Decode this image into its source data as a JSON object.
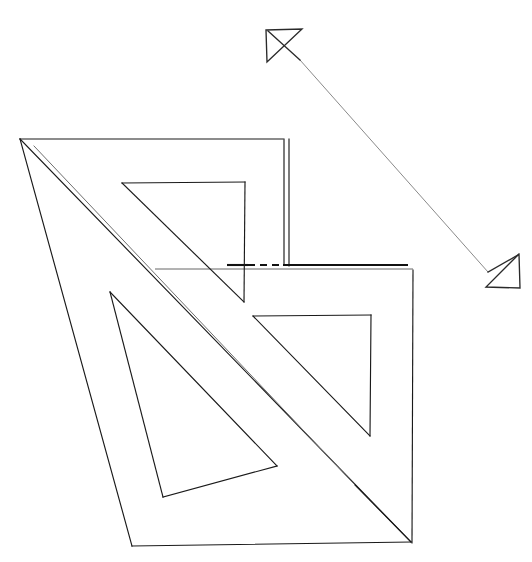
{
  "document": {
    "title": "Technical line drawing — overlapping set-square triangles with leader arrows",
    "canvas": {
      "width": 532,
      "height": 562
    },
    "background_color": "#ffffff",
    "line_color": "#1a1a1a",
    "light_line_color": "#6e6e6e",
    "leader_color": "#8a8a8a",
    "heavy_line_color": "#111111"
  },
  "figure": {
    "outer_triangle_a": {
      "label": "large set square outline",
      "outline_points": "20,139 288,139 288,264",
      "hypotenuse": "20,139 411,542",
      "left_edge": "20,139 132,546",
      "bottom_edge": "132,546 411,542"
    },
    "outer_triangle_b": {
      "label": "second set square outline",
      "top_edge": "20,139 283,139",
      "right_vertical_outer": "289,139 289,266",
      "right_vertical_inner": "284,139 284,264",
      "right_edge_lower": "413,270 412,543",
      "top_right_corner": "413,270",
      "bottom_right_corner": "412,543"
    },
    "inner_cutout_top": {
      "label": "upper inner triangular cutout",
      "points": "122,183 245,182 244,302"
    },
    "inner_cutout_right": {
      "label": "lower-right inner triangular cutout",
      "points": "253,316 371,315 370,436"
    },
    "inner_cutout_left": {
      "label": "lower-left inner triangular cutout",
      "points": "110,292 163,497 277,466"
    },
    "inner_band": {
      "label": "inner parallel band of large triangle",
      "path": "34,146 355,485 411,542"
    },
    "dimension_line": {
      "label": "horizontal dimension / reference line",
      "heavy_left_x": 227,
      "heavy_right_x": 408,
      "y": 265,
      "dash_start_x": 248,
      "dash_end_x": 283,
      "thin_line": "155,269 413,269"
    },
    "leader": {
      "label": "leader line between arrowheads",
      "start": "300,60",
      "end": "488,272"
    },
    "arrowhead_top_left": {
      "label": "open arrowhead pointing up-left",
      "points": "266,30 302,29 267,62 266,30",
      "barb": "300,60 268,31"
    },
    "arrowhead_bottom_right": {
      "label": "open arrowhead pointing down-right",
      "points": "519,254 520,288 486,287 519,254",
      "barb": "488,272 518,255"
    }
  },
  "chart_data": {
    "type": "table",
    "columns": [
      "element",
      "coordinates"
    ],
    "rows": [
      [
        "outer triangle top-left vertex",
        "20,139"
      ],
      [
        "outer triangle bottom-left vertex",
        "132,546"
      ],
      [
        "outer triangle bottom-right vertex",
        "411,542"
      ],
      [
        "right vertical top",
        "288,139"
      ],
      [
        "right vertical bottom",
        "288,264"
      ],
      [
        "lower right edge top",
        "413,270"
      ],
      [
        "lower right edge bottom",
        "412,543"
      ],
      [
        "upper cutout",
        "122,183 / 245,182 / 244,302"
      ],
      [
        "lower-right cutout",
        "253,316 / 371,315 / 370,436"
      ],
      [
        "lower-left cutout",
        "110,292 / 163,497 / 277,466"
      ],
      [
        "dimension line y",
        "265"
      ],
      [
        "thin reference line y",
        "269"
      ],
      [
        "top-left arrowhead bbox",
        "266,28 - 302,62"
      ],
      [
        "bottom-right arrowhead bbox",
        "486,253 - 520,288"
      ]
    ]
  }
}
